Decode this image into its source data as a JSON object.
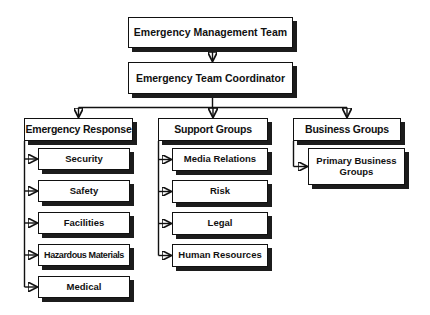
{
  "org_chart": {
    "root": {
      "label": "Emergency Management Team"
    },
    "coordinator": {
      "label": "Emergency Team Coordinator"
    },
    "branches": [
      {
        "label": "Emergency Response",
        "children": [
          {
            "label": "Security"
          },
          {
            "label": "Safety"
          },
          {
            "label": "Facilities"
          },
          {
            "label": "Hazardous Materials"
          },
          {
            "label": "Medical"
          }
        ]
      },
      {
        "label": "Support Groups",
        "children": [
          {
            "label": "Media Relations"
          },
          {
            "label": "Risk"
          },
          {
            "label": "Legal"
          },
          {
            "label": "Human Resources"
          }
        ]
      },
      {
        "label": "Business Groups",
        "children": [
          {
            "label": "Primary Business Groups"
          }
        ]
      }
    ],
    "colors": {
      "box_fill": "#ffffff",
      "box_border": "#111111",
      "box_shadow": "#1c1c1c",
      "connector": "#111111",
      "text": "#111111",
      "background": "#ffffff"
    }
  }
}
